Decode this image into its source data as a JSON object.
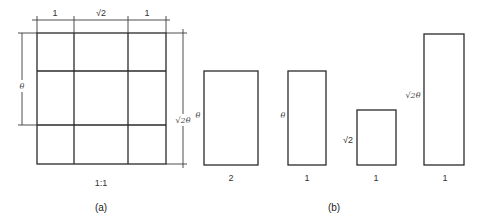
{
  "figure_a": {
    "caption": "(a)",
    "ratio_label": "1:1",
    "top_dims": [
      "1",
      "√2",
      "1"
    ],
    "left_dim": "θ",
    "right_dim": "√2θ"
  },
  "figure_b": {
    "caption": "(b)",
    "rects": [
      {
        "side_label": "θ",
        "bottom_label": "2"
      },
      {
        "side_label": "θ",
        "bottom_label": "1"
      },
      {
        "side_label": "√2",
        "bottom_label": "1"
      },
      {
        "side_label": "√2θ",
        "bottom_label": "1"
      }
    ]
  }
}
